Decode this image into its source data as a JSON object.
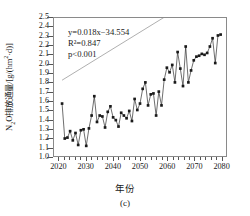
{
  "figure": {
    "panel_label": "(c)",
    "xlabel": "年份",
    "ylabel_html": "N₂O排放通量/[g/(hm²·d)]",
    "ylabel_plain": "N2O排放通量/[g/(hm2·d)]"
  },
  "annotation": {
    "equation": "y=0.018x−34.554",
    "r2": "R²=0.847",
    "pvalue": "p<0.001",
    "equation_slope": 0.018,
    "equation_intercept": -34.554,
    "r_squared": 0.847,
    "p_text": "p<0.001"
  },
  "colors": {
    "marker": "#1a1a1a",
    "series_line": "#2b2b2b",
    "trend_line": "#9a9a9a",
    "frame": "#8a8a8a",
    "text": "#1a1a1a"
  },
  "chart_data": {
    "type": "line",
    "title": "",
    "subtitle": "",
    "xlabel": "年份",
    "ylabel": "N₂O排放通量/[g/(hm²·d)]",
    "xlim": [
      2018,
      2082
    ],
    "ylim": [
      1.0,
      2.5
    ],
    "xticks": [
      2020,
      2030,
      2040,
      2050,
      2060,
      2070,
      2080
    ],
    "yticks": [
      1.0,
      1.1,
      1.2,
      1.3,
      1.4,
      1.5,
      1.6,
      1.7,
      1.8,
      1.9,
      2.0,
      2.1,
      2.2,
      2.3,
      2.4,
      2.5
    ],
    "xtick_labels": [
      "2020",
      "2030",
      "2040",
      "2050",
      "2060",
      "2070",
      "2080"
    ],
    "ytick_labels": [
      "1.0",
      "1.1",
      "1.2",
      "1.3",
      "1.4",
      "1.5",
      "1.6",
      "1.7",
      "1.8",
      "1.9",
      "2.0",
      "2.1",
      "2.2",
      "2.3",
      "2.4",
      "2.5"
    ],
    "grid": false,
    "legend": false,
    "legend_position": "none",
    "marker_style": "filled-square",
    "annotations": [
      "y=0.018x−34.554",
      "R²=0.847",
      "p<0.001"
    ],
    "x": [
      2021,
      2022,
      2023,
      2024,
      2025,
      2026,
      2027,
      2028,
      2029,
      2030,
      2031,
      2032,
      2033,
      2034,
      2035,
      2036,
      2037,
      2038,
      2039,
      2040,
      2041,
      2042,
      2043,
      2044,
      2045,
      2046,
      2047,
      2048,
      2049,
      2050,
      2051,
      2052,
      2053,
      2054,
      2055,
      2056,
      2057,
      2058,
      2059,
      2060,
      2061,
      2062,
      2063,
      2064,
      2065,
      2066,
      2067,
      2068,
      2069,
      2070,
      2071,
      2072,
      2073,
      2074,
      2075,
      2076,
      2077,
      2078,
      2079,
      2080
    ],
    "series": [
      {
        "name": "N2O排放通量",
        "values": [
          1.57,
          1.19,
          1.2,
          1.27,
          1.17,
          1.25,
          1.12,
          1.28,
          1.29,
          1.11,
          1.3,
          1.44,
          1.65,
          1.37,
          1.44,
          1.43,
          1.31,
          1.48,
          1.54,
          1.42,
          1.39,
          1.32,
          1.47,
          1.44,
          1.41,
          1.49,
          1.38,
          1.62,
          1.5,
          1.57,
          1.73,
          1.8,
          1.55,
          1.67,
          1.68,
          1.44,
          1.7,
          1.55,
          1.83,
          1.96,
          1.91,
          1.99,
          1.8,
          2.13,
          1.95,
          1.76,
          2.19,
          1.8,
          1.93,
          2.04,
          2.08,
          2.09,
          2.11,
          2.1,
          2.12,
          2.19,
          2.28,
          2.01,
          2.31,
          2.32
        ]
      }
    ],
    "trend": {
      "name": "线性趋势线",
      "x_start": 2021,
      "x_end": 2080,
      "y_start": 1.824,
      "y_end": 2.886,
      "equation": "y=0.018x−34.554"
    }
  }
}
